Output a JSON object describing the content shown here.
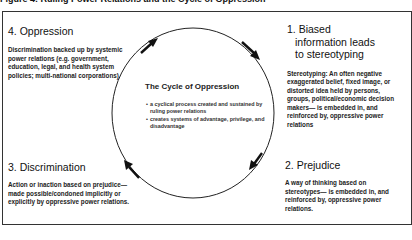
{
  "caption": "Figure 4: Ruling Power Relations and the Cycle of Oppression",
  "center": {
    "title": "The Cycle of Oppression",
    "bullets": [
      "a cyclical process created and sustained by ruling power relations",
      "creates systems of advantage, privilege, and disadvantage"
    ]
  },
  "stages": [
    {
      "number": "1.",
      "title_line1": "Biased",
      "title_line2": "information leads",
      "title_line3": "to stereotyping",
      "description": "Stereotyping: An often negative exaggerated belief, fixed image, or distorted idea held by persons, groups, political/economic decision makers— is embedded in, and reinforced by, oppressive power relations"
    },
    {
      "number": "2.",
      "title": "Prejudice",
      "description": "A way of thinking based on stereotypes— is embedded in, and reinforced by, oppressive power relations."
    },
    {
      "number": "3.",
      "title": "Discrimination",
      "description": "Action or inaction based on prejudice— made possible/condoned implicitly or explicitly by oppressive power relations."
    },
    {
      "number": "4.",
      "title": "Oppression",
      "description": "Discrimination backed up by systemic power relations (e.g. government, education, legal, and health system policies; multi-national corporations)"
    }
  ],
  "cycle": {
    "direction": "clockwise",
    "arrow_count": 4,
    "stroke_color": "#222222"
  }
}
